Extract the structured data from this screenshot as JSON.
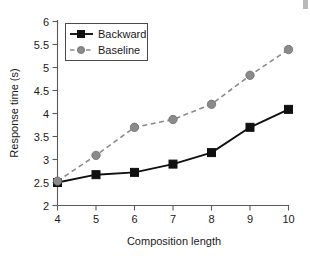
{
  "chart_data": {
    "type": "line",
    "title": "",
    "xlabel": "Composition length",
    "ylabel": "Response time (s)",
    "x": [
      4,
      5,
      6,
      7,
      8,
      9,
      10
    ],
    "xlim": [
      4,
      10
    ],
    "ylim": [
      2,
      6
    ],
    "xticks": [
      "4",
      "5",
      "6",
      "7",
      "8",
      "9",
      "10"
    ],
    "yticks": [
      "2",
      "2.5",
      "3",
      "3.5",
      "4",
      "4.5",
      "5",
      "5.5",
      "6"
    ],
    "grid": false,
    "legend_position": "upper-left",
    "series": [
      {
        "name": "Backward",
        "values": [
          2.5,
          2.67,
          2.72,
          2.9,
          3.15,
          3.7,
          4.09
        ],
        "color": "#101010",
        "linestyle": "solid",
        "marker": "square"
      },
      {
        "name": "Baseline",
        "values": [
          2.53,
          3.09,
          3.7,
          3.87,
          4.2,
          4.83,
          5.39
        ],
        "color": "#8a8a8a",
        "linestyle": "dashed",
        "marker": "circle"
      }
    ]
  },
  "legend": {
    "entries": [
      {
        "label": "Backward"
      },
      {
        "label": "Baseline"
      }
    ]
  },
  "axes": {
    "x_title": "Composition length",
    "y_title": "Response time (s)"
  }
}
